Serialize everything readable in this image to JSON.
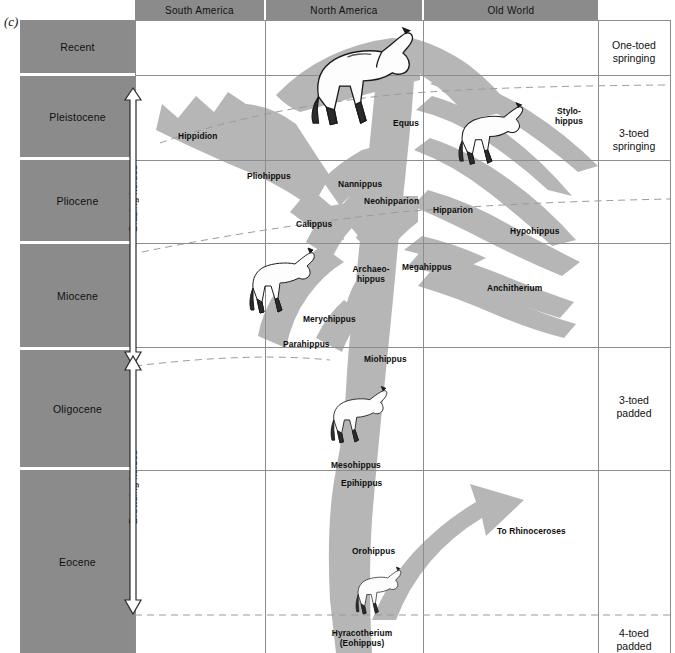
{
  "figure": {
    "label": "(c)"
  },
  "columns": [
    {
      "name": "south-america",
      "label": "South America"
    },
    {
      "name": "north-america",
      "label": "North America"
    },
    {
      "name": "old-world",
      "label": "Old World"
    }
  ],
  "epochs": [
    {
      "name": "recent",
      "label": "Recent"
    },
    {
      "name": "pleistocene",
      "label": "Pleistocene"
    },
    {
      "name": "pliocene",
      "label": "Pliocene"
    },
    {
      "name": "miocene",
      "label": "Miocene"
    },
    {
      "name": "oligocene",
      "label": "Oligocene"
    },
    {
      "name": "eocene",
      "label": "Eocene"
    }
  ],
  "foot_types": [
    {
      "name": "one-toed-springing",
      "label": "One-toed\nspringing"
    },
    {
      "name": "three-toed-springing",
      "label": "3-toed\nspringing"
    },
    {
      "name": "three-toed-padded",
      "label": "3-toed\npadded"
    },
    {
      "name": "four-toed-padded",
      "label": "4-toed\npadded"
    }
  ],
  "feeding_ranges": [
    {
      "name": "grazing-horses",
      "label": "Grazing horses"
    },
    {
      "name": "browsing-horses",
      "label": "Browsing horses"
    }
  ],
  "taxa": [
    {
      "name": "equus",
      "label": "Equus"
    },
    {
      "name": "hippidion",
      "label": "Hippidion"
    },
    {
      "name": "stylohippus",
      "label": "Stylo-\nhippus"
    },
    {
      "name": "pliohippus",
      "label": "Pliohippus"
    },
    {
      "name": "nannippus",
      "label": "Nannippus"
    },
    {
      "name": "neohipparion",
      "label": "Neohipparion"
    },
    {
      "name": "hipparion",
      "label": "Hipparion"
    },
    {
      "name": "calippus",
      "label": "Calippus"
    },
    {
      "name": "hypohippus",
      "label": "Hypohippus"
    },
    {
      "name": "archaeohippus",
      "label": "Archaeo-\nhippus"
    },
    {
      "name": "megahippus",
      "label": "Megahippus"
    },
    {
      "name": "anchitherium",
      "label": "Anchitherium"
    },
    {
      "name": "merychippus",
      "label": "Merychippus"
    },
    {
      "name": "parahippus",
      "label": "Parahippus"
    },
    {
      "name": "miohippus",
      "label": "Miohippus"
    },
    {
      "name": "mesohippus",
      "label": "Mesohippus"
    },
    {
      "name": "epihippus",
      "label": "Epihippus"
    },
    {
      "name": "orohippus",
      "label": "Orohippus"
    },
    {
      "name": "hyracotherium",
      "label": "Hyracotherium\n(Eohippus)"
    }
  ],
  "branches": [
    {
      "name": "to-rhinoceroses",
      "label": "To Rhinoceroses"
    }
  ],
  "colors": {
    "epoch_fill": "#8b8b8b",
    "header_fill": "#8b8b8b",
    "tree_fill": "#b5b5b5",
    "grid": "#8d8d8d",
    "dash": "#9a9a9a",
    "text": "#111111"
  }
}
